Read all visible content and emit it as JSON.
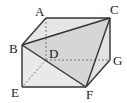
{
  "figure": {
    "type": "solid-geometry",
    "vertices": {
      "A": {
        "label": "A",
        "x": 46,
        "y": 18
      },
      "B": {
        "label": "B",
        "x": 22,
        "y": 45
      },
      "C": {
        "label": "C",
        "x": 110,
        "y": 18
      },
      "D": {
        "label": "D",
        "x": 46,
        "y": 60
      },
      "E": {
        "label": "E",
        "x": 22,
        "y": 87
      },
      "F": {
        "label": "F",
        "x": 86,
        "y": 87
      },
      "G": {
        "label": "G",
        "x": 110,
        "y": 60
      }
    },
    "visible_edges": [
      "AC",
      "AB",
      "BC",
      "BE",
      "EF",
      "BF",
      "CF",
      "CG",
      "GF"
    ],
    "hidden_edges": [
      "AD",
      "DG",
      "DE"
    ],
    "colors": {
      "face_fill": "#e6e6e6",
      "triangle_fill": "#d6d6d6",
      "edge": "#333333",
      "hidden_edge": "#777777"
    }
  }
}
